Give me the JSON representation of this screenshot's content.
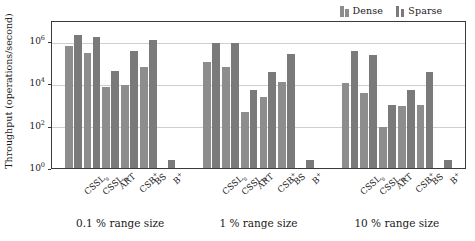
{
  "chart_data": {
    "type": "bar",
    "title": "",
    "xlabel": "",
    "ylabel": "Throughput (operations/second)",
    "yscale": "log",
    "ylim": [
      1,
      10000000
    ],
    "ytick_labels": [
      "10",
      "10",
      "10",
      "10"
    ],
    "ytick_exponents": [
      "0",
      "2",
      "4",
      "6"
    ],
    "ytick_values": [
      1,
      100,
      10000,
      1000000
    ],
    "grid": true,
    "legend_position": "top-right",
    "legend": [
      {
        "name": "Dense",
        "color": "#8d8d8d"
      },
      {
        "name": "Sparse",
        "color": "#7a7a7a"
      }
    ],
    "categories": [
      "CSSLs",
      "CSSLa",
      "ART",
      "CSB+",
      "BS",
      "B+"
    ],
    "category_labels": [
      {
        "base": "CSSL",
        "sub": "s",
        "sup": ""
      },
      {
        "base": "CSSL",
        "sub": "a",
        "sup": ""
      },
      {
        "base": "ART",
        "sub": "",
        "sup": ""
      },
      {
        "base": "CSB",
        "sub": "",
        "sup": "+"
      },
      {
        "base": "BS",
        "sub": "",
        "sup": ""
      },
      {
        "base": "B",
        "sub": "",
        "sup": "+"
      }
    ],
    "groups": [
      {
        "label": "0.1 % range size",
        "series": [
          {
            "name": "Dense",
            "values": [
              560000,
              270000,
              6800,
              8200,
              62000,
              0
            ]
          },
          {
            "name": "Sparse",
            "values": [
              2000000,
              1600000,
              40000,
              330000,
              1100000,
              2.3
            ]
          }
        ]
      },
      {
        "label": "1 % range size",
        "series": [
          {
            "name": "Dense",
            "values": [
              105000,
              62000,
              460,
              2400,
              11500,
              0
            ]
          },
          {
            "name": "Sparse",
            "values": [
              850000,
              780000,
              4800,
              33000,
              240000,
              2.3
            ]
          }
        ]
      },
      {
        "label": "10 % range size",
        "series": [
          {
            "name": "Dense",
            "values": [
              11000,
              3500,
              85,
              900,
              980,
              0
            ]
          },
          {
            "name": "Sparse",
            "values": [
              360000,
              230000,
              1000,
              4700,
              36000,
              2.3
            ]
          }
        ]
      }
    ]
  }
}
